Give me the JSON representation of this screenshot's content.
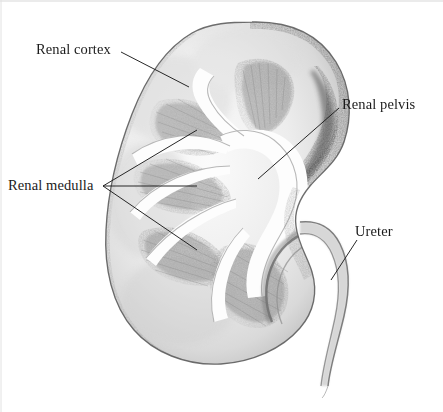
{
  "figure": {
    "medium": "pencil sketch",
    "background_color": "#ffffff",
    "ink_color": "#1b1b1b",
    "canvas": {
      "width": 443,
      "height": 412
    }
  },
  "labels": [
    {
      "id": "renal-cortex",
      "text": "Renal cortex",
      "leader": {
        "from": [
          121,
          52
        ],
        "to": [
          189,
          86
        ],
        "branches": 1
      }
    },
    {
      "id": "renal-pelvis",
      "text": "Renal pelvis",
      "leader": {
        "from": [
          338,
          108
        ],
        "to": [
          258,
          178
        ],
        "branches": 1
      }
    },
    {
      "id": "renal-medulla",
      "text": "Renal medulla",
      "leader": {
        "from": [
          103,
          186
        ],
        "to": [
          196,
          186
        ],
        "branches": 3
      }
    },
    {
      "id": "ureter",
      "text": "Ureter",
      "leader": {
        "from": [
          356,
          240
        ],
        "to": [
          331,
          279
        ],
        "branches": 1
      }
    }
  ],
  "structures": {
    "cortex": {
      "name": "Renal cortex",
      "description": "Pale outer shell of the kidney, darker stippling along the convex outer border",
      "shade": "#b9b9b9"
    },
    "medulla": {
      "name": "Renal medulla",
      "description": "Five wedge-shaped medullary pyramids radiating toward the hilum",
      "shade": "#8e8e8e",
      "pyramid_count": 5
    },
    "pelvis": {
      "name": "Renal pelvis",
      "description": "Open white funnel-shaped collecting space at the hilum",
      "shade": "#ffffff"
    },
    "ureter": {
      "name": "Ureter",
      "description": "Narrow double-walled tube leaving the hilum, curving down and to the left",
      "shade": "#9a9a9a"
    }
  },
  "frame": {
    "visible_edges": "faint top and left rule",
    "color": "#d8d8d8"
  }
}
